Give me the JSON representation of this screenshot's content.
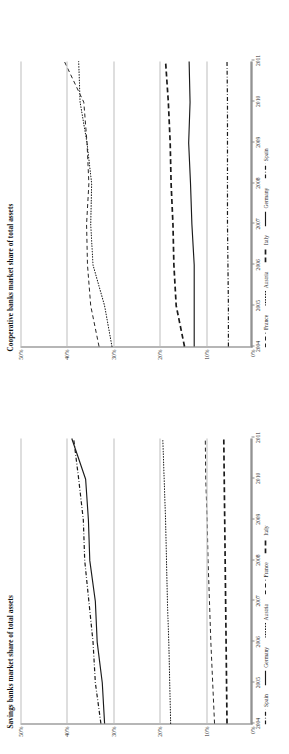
{
  "figure": {
    "background": "#ffffff",
    "line_color": "#1a1a1a",
    "grid_color": "#bdbdbd",
    "axis_color": "#6f6f6f",
    "orientation": "rotated-90-ccw"
  },
  "charts": [
    {
      "id": "cooperative-banks",
      "title": "Cooperative banks market share of total assets",
      "legend": [
        {
          "name": "France",
          "style": "dashed-thin"
        },
        {
          "name": "Austria",
          "style": "dotted"
        },
        {
          "name": "Italy",
          "style": "dashed-thick"
        },
        {
          "name": "Germany",
          "style": "solid"
        },
        {
          "name": "Spain",
          "style": "dash-dot"
        }
      ]
    },
    {
      "id": "savings-banks",
      "title": "Savings banks market share of total assets",
      "legend": [
        {
          "name": "Spain",
          "style": "dash-dot"
        },
        {
          "name": "Germany",
          "style": "solid"
        },
        {
          "name": "Austria",
          "style": "dotted"
        },
        {
          "name": "France",
          "style": "dashed-thin"
        },
        {
          "name": "Italy",
          "style": "dashed-thick"
        }
      ]
    }
  ],
  "axis": {
    "y_ticks": [
      "0%",
      "10%",
      "20%",
      "30%",
      "40%",
      "50%"
    ],
    "x_ticks": [
      "2004",
      "2005",
      "2006",
      "2007",
      "2008",
      "2009",
      "2010",
      "2011"
    ]
  },
  "chart_data": [
    {
      "type": "line",
      "title": "Cooperative banks market share of total assets",
      "xlabel": "",
      "ylabel": "",
      "x": [
        2004,
        2005,
        2006,
        2007,
        2008,
        2009,
        2010,
        2011
      ],
      "xtick_labels": [
        "2004",
        "2005",
        "2006",
        "2007",
        "2008",
        "2009",
        "2010",
        "2011"
      ],
      "ylim": [
        0,
        50
      ],
      "ytick_labels": [
        "0%",
        "10%",
        "20%",
        "30%",
        "40%",
        "50%"
      ],
      "grid": true,
      "legend_position": "below-axis",
      "units": "percent of total assets",
      "series": [
        {
          "name": "France",
          "style": "dashed-thin",
          "values": [
            33.0,
            34.8,
            35.5,
            35.7,
            35.2,
            35.6,
            36.3,
            40.5
          ]
        },
        {
          "name": "Austria",
          "style": "dotted",
          "values": [
            30.2,
            31.8,
            34.3,
            34.8,
            34.6,
            35.6,
            37.1,
            37.4
          ]
        },
        {
          "name": "Italy",
          "style": "dashed-thick",
          "values": [
            14.5,
            16.3,
            16.8,
            17.0,
            17.4,
            17.6,
            18.0,
            18.6
          ]
        },
        {
          "name": "Germany",
          "style": "solid",
          "values": [
            12.4,
            12.4,
            12.4,
            12.9,
            13.2,
            13.6,
            13.3,
            13.5
          ]
        },
        {
          "name": "Spain",
          "style": "dash-dot",
          "values": [
            5.0,
            5.0,
            5.1,
            5.2,
            5.2,
            5.2,
            5.2,
            5.3
          ]
        }
      ]
    },
    {
      "type": "line",
      "title": "Savings banks market share of total assets",
      "xlabel": "",
      "ylabel": "",
      "x": [
        2004,
        2005,
        2006,
        2007,
        2008,
        2009,
        2010,
        2011
      ],
      "xtick_labels": [
        "2004",
        "2005",
        "2006",
        "2007",
        "2008",
        "2009",
        "2010",
        "2011"
      ],
      "ylim": [
        0,
        50
      ],
      "ytick_labels": [
        "0%",
        "10%",
        "20%",
        "30%",
        "40%",
        "50%"
      ],
      "grid": true,
      "legend_position": "below-axis",
      "units": "percent of total assets",
      "series": [
        {
          "name": "Spain",
          "style": "dash-dot",
          "values": [
            32.6,
            33.8,
            34.3,
            35.2,
            36.1,
            36.4,
            37.4,
            38.5
          ]
        },
        {
          "name": "Germany",
          "style": "solid",
          "values": [
            31.8,
            32.3,
            33.4,
            33.8,
            35.0,
            35.3,
            35.9,
            38.9
          ]
        },
        {
          "name": "Austria",
          "style": "dotted",
          "values": [
            17.5,
            17.7,
            17.9,
            18.2,
            18.4,
            18.6,
            18.9,
            19.2
          ]
        },
        {
          "name": "France",
          "style": "dashed-thin",
          "values": [
            8.0,
            8.4,
            8.8,
            9.1,
            9.4,
            9.6,
            9.9,
            10.0
          ]
        },
        {
          "name": "Italy",
          "style": "dashed-thick",
          "values": [
            5.3,
            5.4,
            5.5,
            5.6,
            5.7,
            5.8,
            5.9,
            6.0
          ]
        }
      ]
    }
  ]
}
